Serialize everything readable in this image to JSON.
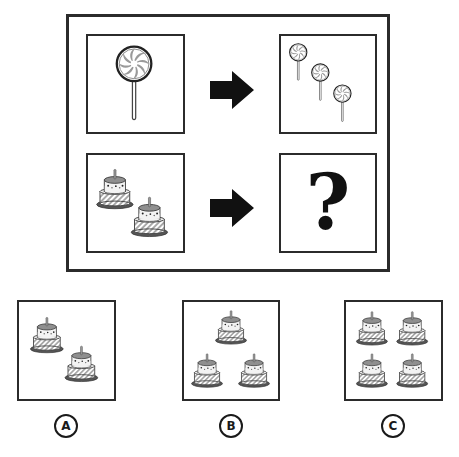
{
  "puzzle": {
    "type": "analogy",
    "colors": {
      "border": "#2b2b2b",
      "arrow": "#111111",
      "icon_gray": "#9a9a9a",
      "icon_dark": "#555555"
    },
    "top_row": {
      "left": {
        "icon": "lollipop-icon",
        "count": 1
      },
      "arrow": "right-arrow-icon",
      "right": {
        "icon": "lollipop-icon",
        "count": 3
      }
    },
    "bottom_row": {
      "left": {
        "icon": "cake-icon",
        "count": 2
      },
      "arrow": "right-arrow-icon",
      "right": {
        "question": "?"
      }
    }
  },
  "options": [
    {
      "label": "A",
      "icon": "cake-icon",
      "count": 2
    },
    {
      "label": "B",
      "icon": "cake-icon",
      "count": 3
    },
    {
      "label": "C",
      "icon": "cake-icon",
      "count": 4
    }
  ]
}
